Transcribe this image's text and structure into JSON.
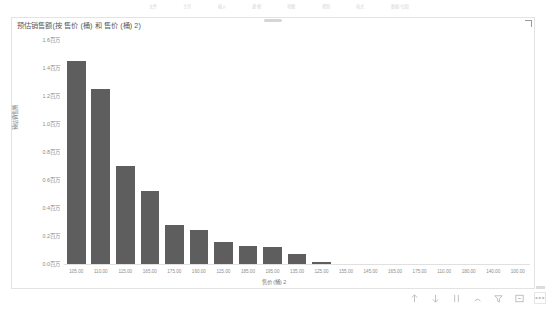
{
  "app": {
    "top_strip_items": [
      "文件",
      "主页",
      "插入",
      "建模",
      "视图",
      "帮助",
      "格式",
      "数据/钻取"
    ]
  },
  "visual": {
    "title": "预估销售额(按 售价 (桶) 和 售价 (桶) 2)",
    "drag_handle_name": "visual-drag-handle",
    "resize_handle_name": "visual-resize-handle"
  },
  "chart_data": {
    "type": "bar",
    "title": "预估销售额(按 售价 (桶) 和 售价 (桶) 2)",
    "xlabel": "售价 (桶) 2",
    "ylabel": "预估销售额",
    "categories": [
      "105.00",
      "110.00",
      "115.00",
      "165.00",
      "175.00",
      "160.00",
      "115.00",
      "185.00",
      "195.00",
      "135.00",
      "125.00",
      "155.00",
      "145.00",
      "165.00",
      "175.00",
      "110.00",
      "180.00",
      "140.00",
      "100.00"
    ],
    "values": [
      1450000,
      1250000,
      700000,
      520000,
      280000,
      240000,
      160000,
      130000,
      120000,
      75000,
      12000,
      0,
      0,
      0,
      0,
      0,
      0,
      0,
      0
    ],
    "ytick_labels": [
      "1.6百万",
      "1.4百万",
      "1.2百万",
      "1.0百万",
      "0.8百万",
      "0.6百万",
      "0.4百万",
      "0.2百万",
      "0.0百万"
    ],
    "ytick_values": [
      1600000,
      1400000,
      1200000,
      1000000,
      800000,
      600000,
      400000,
      200000,
      0
    ],
    "ylim": [
      0,
      1600000
    ],
    "grid": false,
    "legend": "none",
    "bar_color": "#5e5e5e"
  },
  "toolbar": {
    "items": [
      {
        "name": "drill-up-icon",
        "label": "向上钻取"
      },
      {
        "name": "drill-down-icon",
        "label": "向下钻取"
      },
      {
        "name": "expand-hierarchy-icon",
        "label": "展开层次结构"
      },
      {
        "name": "drill-mode-icon",
        "label": "钻取模式"
      },
      {
        "name": "filter-icon",
        "label": "筛选器"
      },
      {
        "name": "focus-mode-icon",
        "label": "聚焦模式"
      },
      {
        "name": "more-options-icon",
        "label": "更多选项"
      }
    ]
  }
}
